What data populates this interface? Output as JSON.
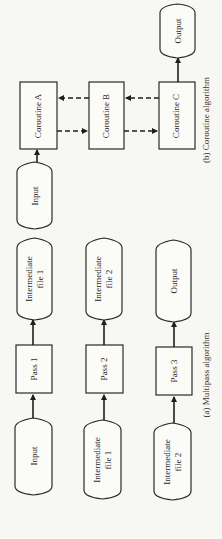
{
  "diagram_b": {
    "caption": "(b) Coroutine algorithm",
    "nodes": {
      "input": "Input",
      "coroutine_a": "Coroutine A",
      "coroutine_b": "Coroutine B",
      "coroutine_c": "Coroutine C",
      "output": "Output"
    }
  },
  "diagram_a": {
    "caption": "(a) Multipass algorithm",
    "rows": [
      {
        "source": [
          "Input"
        ],
        "pass": "Pass 1",
        "target": [
          "Intermediate",
          "file 1"
        ]
      },
      {
        "source": [
          "Intermediate",
          "file 1"
        ],
        "pass": "Pass 2",
        "target": [
          "Intermediate",
          "file 2"
        ]
      },
      {
        "source": [
          "Intermediate",
          "file 2"
        ],
        "pass": "Pass 3",
        "target": [
          "Output"
        ]
      }
    ]
  }
}
